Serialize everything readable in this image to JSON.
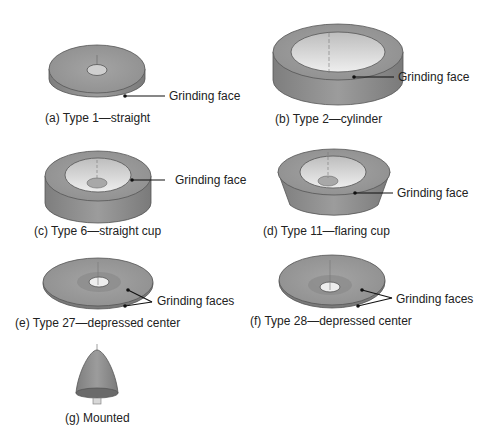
{
  "figure": {
    "panels": [
      {
        "id": "a",
        "caption": "(a) Type 1—straight",
        "callout": "Grinding face"
      },
      {
        "id": "b",
        "caption": "(b) Type 2—cylinder",
        "callout": "Grinding face"
      },
      {
        "id": "c",
        "caption": "(c) Type 6—straight cup",
        "callout": "Grinding face"
      },
      {
        "id": "d",
        "caption": "(d) Type 11—flaring cup",
        "callout": "Grinding face"
      },
      {
        "id": "e",
        "caption": "(e) Type 27—depressed center",
        "callout": "Grinding faces"
      },
      {
        "id": "f",
        "caption": "(f) Type 28—depressed center",
        "callout": "Grinding faces"
      },
      {
        "id": "g",
        "caption": "(g) Mounted",
        "callout": ""
      }
    ],
    "colors": {
      "wheel_top": "#9a9a9a",
      "wheel_side": "#8a8a8a",
      "wheel_inner": "#d6d6d6",
      "outline": "#555555",
      "leader": "#111111"
    }
  }
}
